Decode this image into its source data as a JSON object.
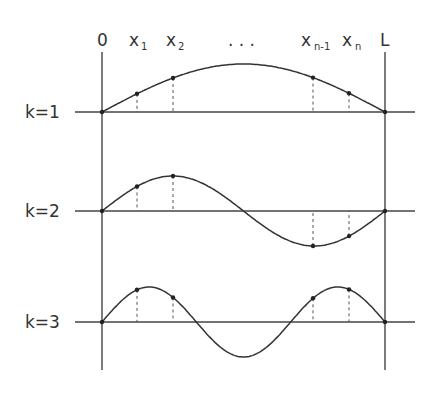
{
  "diagram": {
    "top_labels": {
      "origin": "0",
      "x1_base": "x",
      "x1_sub": "1",
      "x2_base": "x",
      "x2_sub": "2",
      "ellipsis": ". . .",
      "xn1_base": "x",
      "xn1_sub": "n-1",
      "xn_base": "x",
      "xn_sub": "n",
      "end": "L"
    },
    "modes": [
      {
        "label": "k=1",
        "k": 1,
        "baseline_y": 112,
        "amplitude": 48
      },
      {
        "label": "k=2",
        "k": 2,
        "baseline_y": 211,
        "amplitude": 35
      },
      {
        "label": "k=3",
        "k": 3,
        "baseline_y": 322,
        "amplitude": 35
      }
    ],
    "sample_points_x": [
      137,
      173,
      313,
      349
    ],
    "axis_left_x": 102,
    "axis_right_x": 385,
    "colors": {
      "line": "#333333",
      "text": "#333333",
      "background": "#ffffff"
    }
  }
}
